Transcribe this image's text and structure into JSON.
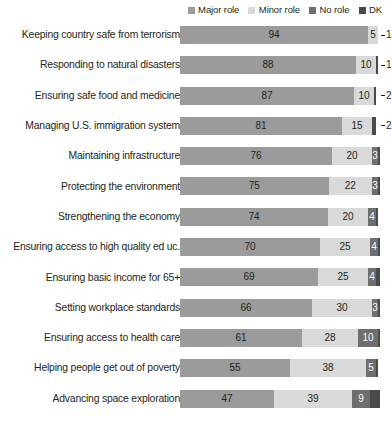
{
  "legend": {
    "items": [
      {
        "label": "Major role",
        "color": "#9b9b9b",
        "key": "major"
      },
      {
        "label": "Minor role",
        "color": "#d9d9d9",
        "key": "minor"
      },
      {
        "label": "No role",
        "color": "#6e6e6e",
        "key": "no"
      },
      {
        "label": "DK",
        "color": "#4a4a4a",
        "key": "dk"
      }
    ]
  },
  "chart_data": {
    "type": "bar",
    "orientation": "horizontal",
    "stacked": true,
    "title": "",
    "subtitle": "",
    "xlabel": "",
    "ylabel": "",
    "xlim": [
      0,
      100
    ],
    "grid": false,
    "legend_position": "top-right",
    "series": [
      {
        "name": "Major role",
        "color": "#9b9b9b"
      },
      {
        "name": "Minor role",
        "color": "#d9d9d9"
      },
      {
        "name": "No role",
        "color": "#6e6e6e"
      },
      {
        "name": "DK",
        "color": "#4a4a4a"
      }
    ],
    "categories": [
      "Keeping country safe from terrorism",
      "Responding to natural disasters",
      "Ensuring safe food and medicine",
      "Managing U.S. immigration system",
      "Maintaining infrastructure",
      "Protecting the environment",
      "Strengthening the economy",
      "Ensuring access to high quality ed uc.",
      "Ensuring basic income for 65+",
      "Setting workplace standards",
      "Ensuring access to health care",
      "Helping people get out of poverty",
      "Advancing space exploration"
    ],
    "rows": [
      {
        "category": "Keeping country safe from terrorism",
        "major": 94,
        "minor": 5,
        "no": 1,
        "dk": 0,
        "no_outside": true,
        "dk_outside": false
      },
      {
        "category": "Responding to natural disasters",
        "major": 88,
        "minor": 10,
        "no": 1,
        "dk": 1,
        "no_outside": true,
        "dk_outside": false
      },
      {
        "category": "Ensuring safe food and medicine",
        "major": 87,
        "minor": 10,
        "no": 2,
        "dk": 1,
        "no_outside": true,
        "dk_outside": false
      },
      {
        "category": "Managing U.S. immigration system",
        "major": 81,
        "minor": 15,
        "no": 2,
        "dk": 2,
        "no_outside": true,
        "dk_outside": false
      },
      {
        "category": "Maintaining infrastructure",
        "major": 76,
        "minor": 20,
        "no": 3,
        "dk": 1,
        "no_outside": false,
        "dk_outside": false
      },
      {
        "category": "Protecting the environment",
        "major": 75,
        "minor": 22,
        "no": 3,
        "dk": 1,
        "no_outside": false,
        "dk_outside": false
      },
      {
        "category": "Strengthening the economy",
        "major": 74,
        "minor": 20,
        "no": 4,
        "dk": 1,
        "no_outside": false,
        "dk_outside": false
      },
      {
        "category": "Ensuring access to high quality ed uc.",
        "major": 70,
        "minor": 25,
        "no": 4,
        "dk": 1,
        "no_outside": false,
        "dk_outside": false
      },
      {
        "category": "Ensuring basic income for 65+",
        "major": 69,
        "minor": 25,
        "no": 4,
        "dk": 2,
        "no_outside": false,
        "dk_outside": false
      },
      {
        "category": "Setting workplace standards",
        "major": 66,
        "minor": 30,
        "no": 3,
        "dk": 1,
        "no_outside": false,
        "dk_outside": false
      },
      {
        "category": "Ensuring access to health care",
        "major": 61,
        "minor": 28,
        "no": 10,
        "dk": 1,
        "no_outside": false,
        "dk_outside": false
      },
      {
        "category": "Helping people get out of poverty",
        "major": 55,
        "minor": 38,
        "no": 5,
        "dk": 1,
        "no_outside": false,
        "dk_outside": false
      },
      {
        "category": "Advancing space exploration",
        "major": 47,
        "minor": 39,
        "no": 9,
        "dk": 5,
        "no_outside": false,
        "dk_outside": false
      }
    ],
    "value_labels": {
      "shown_for": [
        "major",
        "minor",
        "no"
      ],
      "note": "DK values are not printed on the bars; trailing callouts show the No role value for the first four rows"
    }
  }
}
